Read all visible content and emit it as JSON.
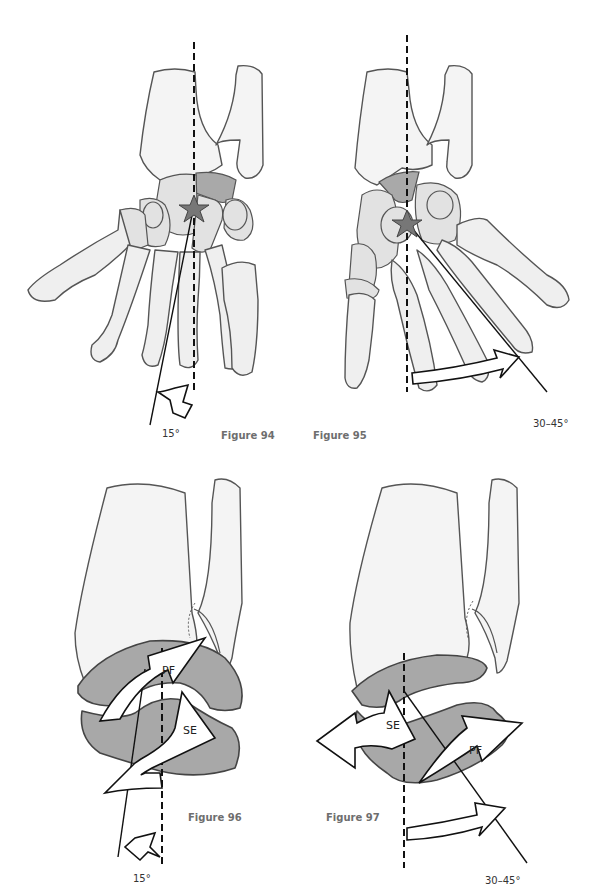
{
  "figures": [
    {
      "id": "figure-94",
      "label": "Figure 94",
      "view": "dorsal view of foot skeleton (forefoot rotated medially)",
      "angle_label": "15°",
      "markers": [
        "star at subtalar pivot",
        "dashed vertical reference axis",
        "solid line axis",
        "curved arrow indicating rotation"
      ]
    },
    {
      "id": "figure-95",
      "label": "Figure 95",
      "view": "dorsal view of foot skeleton (forefoot rotated laterally)",
      "angle_label": "30–45°",
      "markers": [
        "star at subtalar pivot",
        "dashed vertical reference axis",
        "solid line axis",
        "curved arrow indicating rotation"
      ]
    },
    {
      "id": "figure-96",
      "label": "Figure 96",
      "view": "lateral view of ankle joint with talus",
      "angle_label": "15°",
      "arrow_labels": [
        "PF",
        "SE"
      ],
      "markers": [
        "dashed vertical reference axis",
        "solid line axis",
        "curved arrows"
      ]
    },
    {
      "id": "figure-97",
      "label": "Figure 97",
      "view": "lateral view of ankle joint with talus",
      "angle_label": "30–45°",
      "arrow_labels": [
        "SE",
        "PF"
      ],
      "markers": [
        "dashed vertical reference axis",
        "solid line axis",
        "curved arrows"
      ]
    }
  ],
  "colors": {
    "bone_fill": "#efefef",
    "highlight_bone": "#a9a9a9",
    "talus_fill": "#a8a8a8",
    "outline": "#555555",
    "axis_line": "#111111",
    "figure_label": "#6e6e6e"
  }
}
